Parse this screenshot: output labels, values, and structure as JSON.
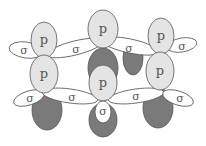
{
  "diagram": {
    "colors": {
      "light_lobe": "#e4e4e4",
      "dark_lobe": "#7a7a7a",
      "sigma_fill": "#ffffff",
      "stroke": "#555555"
    },
    "labels": {
      "p": "p",
      "sigma": "σ"
    },
    "p_orbitals": [
      {
        "id": "top-center",
        "x": 103,
        "y": 40,
        "top_label": "p",
        "bottom_label": ""
      },
      {
        "id": "upper-left",
        "x": 44,
        "y": 58,
        "top_label": "p",
        "bottom_label": "p"
      },
      {
        "id": "upper-right",
        "x": 160,
        "y": 55,
        "top_label": "p",
        "bottom_label": "p"
      },
      {
        "id": "bottom-center",
        "x": 103,
        "y": 100,
        "top_label": "p",
        "bottom_label": "σ"
      }
    ],
    "sigma_bonds": [
      {
        "id": "sigma-far-left-top",
        "label": "σ"
      },
      {
        "id": "sigma-top-left",
        "label": "σ"
      },
      {
        "id": "sigma-top-right",
        "label": "σ"
      },
      {
        "id": "sigma-far-right-top",
        "label": "σ"
      },
      {
        "id": "sigma-far-left-bottom",
        "label": "σ"
      },
      {
        "id": "sigma-bottom-left",
        "label": "σ"
      },
      {
        "id": "sigma-bottom-mid-left",
        "label": "σ"
      },
      {
        "id": "sigma-bottom-mid-right",
        "label": "σ"
      },
      {
        "id": "sigma-far-right-bottom",
        "label": "σ"
      },
      {
        "id": "sigma-lower-center",
        "label": "σ"
      }
    ]
  }
}
